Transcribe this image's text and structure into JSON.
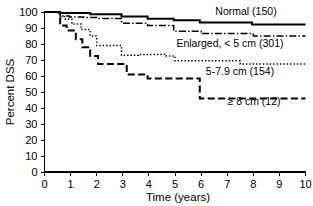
{
  "chart_data": {
    "type": "line",
    "title": "",
    "subtitle": "",
    "xlabel": "Time (years)",
    "ylabel": "Percent DSS",
    "xlim": [
      0,
      10
    ],
    "ylim": [
      0,
      100
    ],
    "xticks": [
      "0",
      "1",
      "2",
      "3",
      "4",
      "5",
      "6",
      "7",
      "8",
      "9",
      "10"
    ],
    "yticks": [
      "0",
      "10",
      "20",
      "30",
      "40",
      "50",
      "60",
      "70",
      "80",
      "90",
      "100"
    ],
    "grid": false,
    "legend_position": "inline-right",
    "series": [
      {
        "name": "Normal (150)",
        "label": "Normal (150)",
        "n": 150,
        "linestyle": "solid",
        "color": "#000000",
        "x": [
          0,
          0.55,
          0.55,
          1.05,
          1.05,
          1.75,
          1.75,
          2.95,
          2.95,
          3.95,
          3.95,
          4.95,
          4.95,
          5.95,
          5.95,
          7.95,
          7.95,
          10
        ],
        "y": [
          100,
          100,
          99.3,
          99.3,
          99.3,
          99.3,
          98.6,
          98.6,
          97.2,
          97.2,
          95.8,
          95.8,
          94.8,
          94.8,
          93.4,
          93.4,
          92.2,
          92.2
        ]
      },
      {
        "name": "Enlarged, < 5 cm (301)",
        "label": "Enlarged, < 5 cm (301)",
        "n": 301,
        "linestyle": "dash-dot",
        "color": "#000000",
        "x": [
          0,
          0.6,
          0.6,
          0.95,
          0.95,
          1.5,
          1.5,
          2.0,
          2.0,
          2.95,
          2.95,
          3.95,
          3.95,
          4.95,
          4.95,
          6.0,
          6.0,
          8.0,
          8.0,
          10
        ],
        "y": [
          100,
          100,
          97.5,
          97.5,
          96.8,
          96.8,
          96.5,
          96.5,
          96.0,
          96.0,
          93.0,
          93.0,
          91.5,
          91.5,
          88.0,
          88.0,
          86.5,
          86.5,
          85.0,
          85.0
        ]
      },
      {
        "name": "5-7.9 cm (154)",
        "label": "5-7.9 cm (154)",
        "n": 154,
        "linestyle": "dotted",
        "color": "#000000",
        "x": [
          0,
          0.6,
          0.6,
          0.8,
          0.8,
          1.05,
          1.05,
          1.4,
          1.4,
          1.75,
          1.75,
          2.0,
          2.0,
          2.95,
          2.95,
          3.6,
          3.6,
          4.6,
          4.6,
          5.0,
          5.0,
          7.5,
          7.5,
          10
        ],
        "y": [
          100,
          100,
          97.2,
          97.2,
          95.5,
          95.5,
          92.5,
          92.5,
          89.0,
          89.0,
          85.0,
          85.0,
          79.0,
          79.0,
          73.0,
          73.0,
          73.5,
          73.5,
          72.5,
          72.5,
          69.5,
          69.5,
          67.5,
          67.5
        ]
      },
      {
        "name": "≥ 8 cm (12)",
        "label": "≥ 8 cm (12)",
        "n": 12,
        "linestyle": "dashed",
        "color": "#000000",
        "x": [
          0,
          0.6,
          0.6,
          0.85,
          0.85,
          1.2,
          1.2,
          1.45,
          1.45,
          1.75,
          1.75,
          2.05,
          2.05,
          2.95,
          2.95,
          3.15,
          3.15,
          3.95,
          3.95,
          5.95,
          5.95,
          10
        ],
        "y": [
          100,
          100,
          91.5,
          91.5,
          88.5,
          88.5,
          83.0,
          83.0,
          78.0,
          78.0,
          72.5,
          72.5,
          67.5,
          67.5,
          67.5,
          67.5,
          61.0,
          61.0,
          58.5,
          58.5,
          46.0,
          46.0
        ]
      }
    ],
    "annotations": [
      {
        "text": "Normal (150)",
        "x_px": 246,
        "y_px": 15
      },
      {
        "text": "Enlarged, < 5 cm (301)",
        "x_px": 230,
        "y_px": 47
      },
      {
        "text": "5-7.9 cm (154)",
        "x_px": 240,
        "y_px": 75
      },
      {
        "text": "≥ 8 cm (12)",
        "x_px": 254,
        "y_px": 105
      }
    ]
  },
  "axes": {
    "y_title": "Percent DSS",
    "x_title": "Time (years)",
    "y_tick_labels": [
      "100",
      "90",
      "80",
      "70",
      "60",
      "50",
      "40",
      "30",
      "20",
      "10",
      "0"
    ],
    "x_tick_labels": [
      "0",
      "1",
      "2",
      "3",
      "4",
      "5",
      "6",
      "7",
      "8",
      "9",
      "10"
    ]
  }
}
